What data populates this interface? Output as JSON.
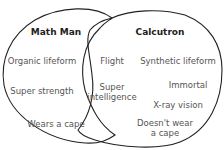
{
  "diagram": {
    "type": "venn",
    "left_set": {
      "title": "Math Man",
      "items": [
        "Organic lifeform",
        "Super strength",
        "Wears a cape"
      ]
    },
    "right_set": {
      "title": "Calcutron",
      "items": [
        "Synthetic lifeform",
        "Immortal",
        "X-ray vision",
        "Doesn't wear a cape"
      ]
    },
    "overlap": {
      "items": [
        "Flight",
        "Super intelligence"
      ]
    },
    "colors": {
      "stroke": "#222222",
      "text": "#555555",
      "title": "#222222"
    }
  }
}
